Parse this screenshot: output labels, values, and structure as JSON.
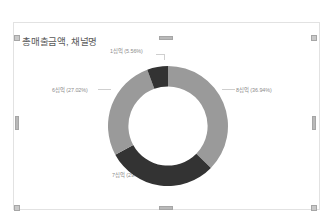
{
  "visual": {
    "title": "총매출금액, 채널명"
  },
  "header": {
    "filter_icon": "funnel-filter-icon",
    "focus_icon": "focus-mode-expand-icon",
    "more_icon": "more-options-ellipsis-icon"
  },
  "colors": {
    "segment_light": "#9a9a9a",
    "segment_dark": "#333333",
    "label_text": "#8b8b8b",
    "title_text": "#5a5a5a",
    "card_border": "#e2e2e2",
    "handle": "#c9c9c9"
  },
  "chart_data": {
    "type": "pie",
    "variant": "donut",
    "title": "총매출금액, 채널명",
    "xlabel": "",
    "ylabel": "",
    "grid": false,
    "legend_position": "none",
    "labels_shown": "category-and-percent",
    "inner_radius_ratio": 0.66,
    "start_angle_deg": 0,
    "categories": [
      "8십억",
      "7십억",
      "6십억",
      "1십억"
    ],
    "percentages": [
      36.94,
      29.46,
      27.02,
      5.56
    ],
    "colors": [
      "#9a9a9a",
      "#333333",
      "#9a9a9a",
      "#333333"
    ],
    "data_labels": [
      {
        "text": "8십억 (36.94%)",
        "position": "right"
      },
      {
        "text": "7십억 (29.46%)",
        "position": "bottom"
      },
      {
        "text": "6십억 (27.02%)",
        "position": "left"
      },
      {
        "text": "1십억 (5.56%)",
        "position": "top"
      }
    ]
  }
}
